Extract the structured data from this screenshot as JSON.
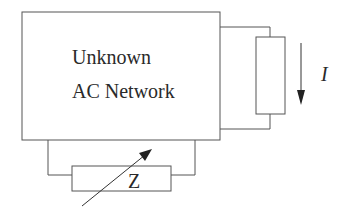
{
  "diagram": {
    "network_box": {
      "line1": "Unknown",
      "line2": "AC Network"
    },
    "load_resistor": {
      "current_label": "I",
      "current_direction": "down"
    },
    "variable_impedance": {
      "label": "Z"
    },
    "colors": {
      "stroke": "#555555",
      "text": "#2a2a2a",
      "background": "#ffffff"
    }
  }
}
